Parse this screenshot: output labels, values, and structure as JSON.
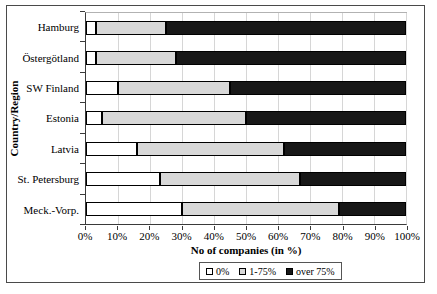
{
  "chart_data": {
    "type": "bar",
    "orientation": "horizontal",
    "stacked": true,
    "title": "",
    "xlabel": "No of companies (in %)",
    "ylabel": "Country/Region",
    "categories": [
      "Hamburg",
      "Östergötland",
      "SW Finland",
      "Estonia",
      "Latvia",
      "St. Petersburg",
      "Meck.-Vorp."
    ],
    "series": [
      {
        "name": "0%",
        "color": "#ffffff",
        "values": [
          3,
          3,
          10,
          5,
          16,
          23,
          30
        ]
      },
      {
        "name": "1-75%",
        "color": "#d8d8d8",
        "values": [
          22,
          25,
          35,
          45,
          46,
          44,
          49
        ]
      },
      {
        "name": "over 75%",
        "color": "#181818",
        "values": [
          75,
          72,
          55,
          50,
          38,
          33,
          21
        ]
      }
    ],
    "xlim": [
      0,
      100
    ],
    "x_ticks": [
      "0%",
      "10%",
      "20%",
      "30%",
      "40%",
      "50%",
      "60%",
      "70%",
      "80%",
      "90%",
      "100%"
    ],
    "grid": "vertical",
    "legend_position": "bottom",
    "grid_color": "#d6d6d6",
    "axis_color": "#3a3a3a",
    "frame_color": "#4a4a4a"
  }
}
